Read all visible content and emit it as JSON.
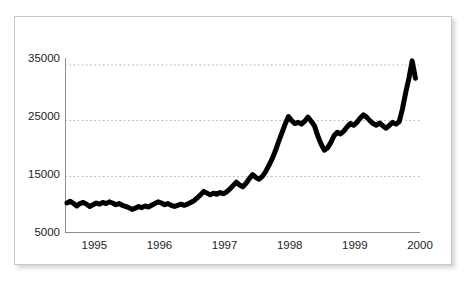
{
  "chart_data": {
    "type": "line",
    "title": "",
    "subtitle": "",
    "xlabel": "",
    "ylabel": "",
    "xlim": [
      1994.55,
      2000.0
    ],
    "ylim": [
      5000,
      35000
    ],
    "grid": true,
    "grid_axis": "y",
    "legend": null,
    "legend_position": "none",
    "line_color": "#000000",
    "line_width_px": 5,
    "grid_color": "#b5b5b5",
    "axis_color": "#8c8c8c",
    "background_color": "#ffffff",
    "ytick_labels": [
      "5000",
      "15000",
      "25000",
      "35000"
    ],
    "ytick_values": [
      5000,
      15000,
      25000,
      35000
    ],
    "xtick_labels": [
      "1995",
      "1996",
      "1997",
      "1998",
      "1999",
      "2000"
    ],
    "xtick_values": [
      1995,
      1996,
      1997,
      1998,
      1999,
      2000
    ],
    "series": [
      {
        "name": "index",
        "x": [
          1994.58,
          1994.63,
          1994.68,
          1994.73,
          1994.78,
          1994.83,
          1994.88,
          1994.93,
          1994.98,
          1995.03,
          1995.08,
          1995.13,
          1995.18,
          1995.23,
          1995.28,
          1995.33,
          1995.38,
          1995.43,
          1995.48,
          1995.53,
          1995.58,
          1995.63,
          1995.68,
          1995.73,
          1995.78,
          1995.83,
          1995.88,
          1995.93,
          1995.98,
          1996.03,
          1996.08,
          1996.13,
          1996.18,
          1996.23,
          1996.28,
          1996.33,
          1996.38,
          1996.43,
          1996.48,
          1996.53,
          1996.58,
          1996.63,
          1996.68,
          1996.73,
          1996.78,
          1996.83,
          1996.88,
          1996.93,
          1996.98,
          1997.03,
          1997.08,
          1997.13,
          1997.18,
          1997.23,
          1997.28,
          1997.33,
          1997.38,
          1997.43,
          1997.48,
          1997.53,
          1997.58,
          1997.63,
          1997.68,
          1997.73,
          1997.78,
          1997.83,
          1997.88,
          1997.93,
          1997.98,
          1998.03,
          1998.08,
          1998.13,
          1998.18,
          1998.23,
          1998.28,
          1998.33,
          1998.38,
          1998.43,
          1998.48,
          1998.53,
          1998.58,
          1998.63,
          1998.68,
          1998.73,
          1998.78,
          1998.83,
          1998.88,
          1998.93,
          1998.98,
          1999.03,
          1999.08,
          1999.13,
          1999.18,
          1999.23,
          1999.28,
          1999.33,
          1999.38,
          1999.43,
          1999.48,
          1999.53,
          1999.58,
          1999.63,
          1999.68,
          1999.73,
          1999.78,
          1999.83,
          1999.88,
          1999.93
        ],
        "values": [
          10000,
          10300,
          9900,
          9500,
          9900,
          10100,
          9800,
          9400,
          9700,
          10000,
          9800,
          10100,
          9900,
          10200,
          10000,
          9700,
          9900,
          9600,
          9400,
          9200,
          8900,
          9100,
          9400,
          9200,
          9500,
          9300,
          9600,
          9900,
          10200,
          10000,
          9700,
          9900,
          9600,
          9400,
          9600,
          9800,
          9600,
          9800,
          10100,
          10400,
          10900,
          11400,
          12000,
          11700,
          11400,
          11700,
          11500,
          11800,
          11600,
          11900,
          12400,
          13000,
          13600,
          13100,
          12800,
          13400,
          14200,
          14900,
          14400,
          14100,
          14600,
          15400,
          16500,
          17600,
          19000,
          20600,
          22100,
          23600,
          24900,
          24200,
          23700,
          23900,
          23600,
          24100,
          24800,
          24100,
          23300,
          21600,
          20200,
          19100,
          19500,
          20400,
          21600,
          22200,
          21900,
          22400,
          23100,
          23700,
          23400,
          23900,
          24600,
          25200,
          24800,
          24200,
          23700,
          23400,
          23800,
          23300,
          22900,
          23400,
          23900,
          23600,
          24000,
          26200,
          29000,
          31500,
          34500,
          31500
        ]
      }
    ]
  },
  "axis": {
    "y_ticks": [
      {
        "label": "35000",
        "value": 35000
      },
      {
        "label": "25000",
        "value": 25000
      },
      {
        "label": "15000",
        "value": 15000
      },
      {
        "label": "5000",
        "value": 5000
      }
    ],
    "x_ticks": [
      {
        "label": "1995",
        "value": 1995
      },
      {
        "label": "1996",
        "value": 1996
      },
      {
        "label": "1997",
        "value": 1997
      },
      {
        "label": "1998",
        "value": 1998
      },
      {
        "label": "1999",
        "value": 1999
      },
      {
        "label": "2000",
        "value": 2000
      }
    ]
  }
}
